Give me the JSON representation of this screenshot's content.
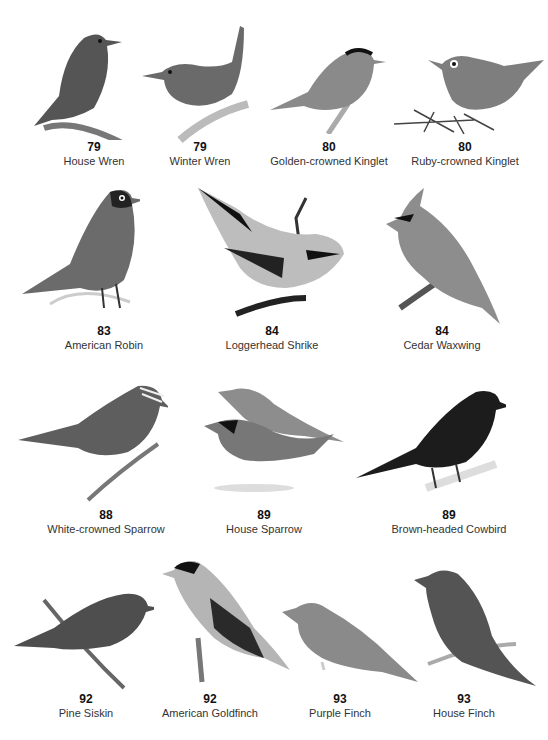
{
  "page": {
    "style": "grayscale field guide plate",
    "rows": [
      {
        "birds": [
          {
            "page": "79",
            "name": "House Wren",
            "tone": "#555555"
          },
          {
            "page": "79",
            "name": "Winter Wren",
            "tone": "#6a6a6a"
          },
          {
            "page": "80",
            "name": "Golden-crowned Kinglet",
            "tone": "#8a8a8a"
          },
          {
            "page": "80",
            "name": "Ruby-crowned Kinglet",
            "tone": "#7e7e7e"
          }
        ]
      },
      {
        "birds": [
          {
            "page": "83",
            "name": "American Robin",
            "tone": "#6b6b6b"
          },
          {
            "page": "84",
            "name": "Loggerhead Shrike",
            "tone": "#bdbdbd"
          },
          {
            "page": "84",
            "name": "Cedar Waxwing",
            "tone": "#8d8d8d"
          }
        ]
      },
      {
        "birds": [
          {
            "page": "88",
            "name": "White-crowned Sparrow",
            "tone": "#5e5e5e"
          },
          {
            "page": "89",
            "name": "House Sparrow",
            "tone": "#777777"
          },
          {
            "page": "89",
            "name": "Brown-headed Cowbird",
            "tone": "#1c1c1c"
          }
        ]
      },
      {
        "birds": [
          {
            "page": "92",
            "name": "Pine Siskin",
            "tone": "#4e4e4e"
          },
          {
            "page": "92",
            "name": "American Goldfinch",
            "tone": "#b5b5b5"
          },
          {
            "page": "93",
            "name": "Purple Finch",
            "tone": "#8a8a8a"
          },
          {
            "page": "93",
            "name": "House Finch",
            "tone": "#545454"
          }
        ]
      }
    ]
  }
}
